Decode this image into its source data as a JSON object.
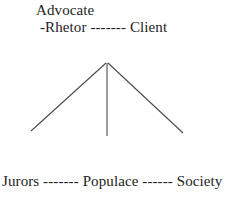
{
  "diagram": {
    "title_text": "Advocate",
    "apex": {
      "label": "Advocate",
      "x": 107,
      "y": 62
    },
    "top_row": {
      "left_label": "-Rhetor",
      "connector": " ------- ",
      "right_label": "Client"
    },
    "bottom_row": {
      "left_label": "Jurors",
      "connector_left": " ------- ",
      "middle_label": "Populace",
      "connector_right": " ------ ",
      "right_label": "Society"
    },
    "lines": [
      {
        "name": "left-leg",
        "x1": 106,
        "y1": 63,
        "x2": 31,
        "y2": 131
      },
      {
        "name": "center-leg",
        "x1": 107,
        "y1": 63,
        "x2": 107,
        "y2": 136
      },
      {
        "name": "right-leg",
        "x1": 108,
        "y1": 63,
        "x2": 183,
        "y2": 133
      }
    ],
    "colors": {
      "background": "#ffffff",
      "text": "#232323",
      "stroke": "#4a4a4a"
    }
  }
}
